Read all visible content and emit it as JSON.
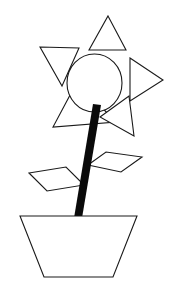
{
  "image": {
    "title": "Flower in a pot line drawing",
    "subject": "flower",
    "style": "black outline line art on white background",
    "width": 179,
    "height": 299,
    "background_color": "#ffffff",
    "stroke_color": "#1a1a1a",
    "fill_color": "#ffffff",
    "stem_color": "#0a0a0a"
  },
  "shapes": {
    "flower_center": {
      "name": "circle",
      "cx": 94.5,
      "cy": 83,
      "rx": 27.5,
      "ry": 29
    },
    "petals": [
      {
        "name": "top-petal",
        "shape": "triangle",
        "points": "108,16 126,50 89,50"
      },
      {
        "name": "upper-left-petal",
        "shape": "triangle",
        "points": "40,47 79,48 62,86"
      },
      {
        "name": "right-petal",
        "shape": "triangle",
        "points": "130,58 163,80 130,101"
      },
      {
        "name": "lower-left-petal",
        "shape": "triangle",
        "points": "77,82 116,122 53,127"
      },
      {
        "name": "lower-right-petal",
        "shape": "triangle",
        "points": "129,96 134,136 100,117"
      }
    ],
    "stem": {
      "name": "stem",
      "shape": "thick-line",
      "points": "93,104 101,105 82,218 74,218",
      "color": "#0a0a0a"
    },
    "leaves": [
      {
        "name": "left-leaf",
        "shape": "parallelogram",
        "points": "29,173 66,167 84,185 47,191"
      },
      {
        "name": "right-leaf",
        "shape": "parallelogram",
        "points": "88,165 106,152 142,157 121,172"
      }
    ],
    "pot": {
      "name": "pot",
      "shape": "trapezoid",
      "points": "20,216 137,216 113,277 44,277"
    }
  },
  "labels": {
    "alt_text": "Line drawing of a flower with five triangular petals and a round center, a thick dark stem, two diamond leaves, and a trapezoidal pot."
  }
}
